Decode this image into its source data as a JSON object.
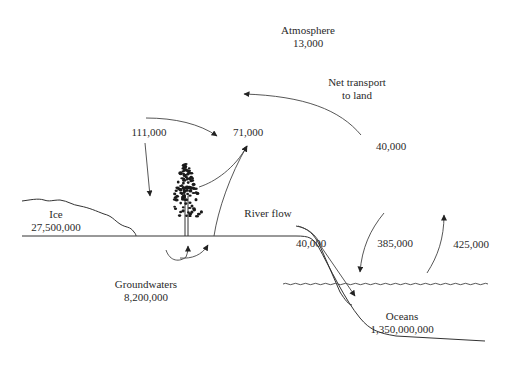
{
  "reservoirs": {
    "atmosphere": {
      "name": "Atmosphere",
      "value": "13,000"
    },
    "ice": {
      "name": "Ice",
      "value": "27,500,000"
    },
    "groundwaters": {
      "name": "Groundwaters",
      "value": "8,200,000"
    },
    "oceans": {
      "name": "Oceans",
      "value": "1,350,000,000"
    }
  },
  "flows": {
    "land_precipitation": "111,000",
    "land_evapotranspiration": "71,000",
    "net_transport_label": "Net transport\nto land",
    "net_transport_line1": "Net transport",
    "net_transport_line2": "to land",
    "net_transport_value": "40,000",
    "river_flow_label": "River flow",
    "river_flow_value": "40,000",
    "ocean_precipitation": "385,000",
    "ocean_evaporation": "425,000"
  }
}
